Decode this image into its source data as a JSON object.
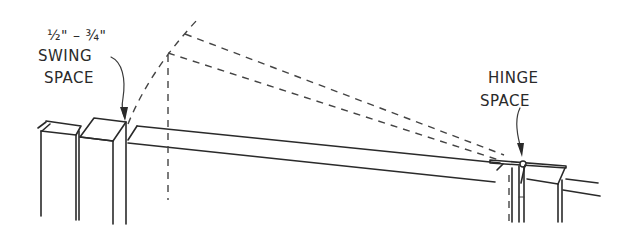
{
  "diagram": {
    "type": "gate-swing-clearance-illustration",
    "labels": {
      "swing_space_dim": "½\" – ¾\"",
      "swing_space_line1": "SWING",
      "swing_space_line2": "SPACE",
      "hinge_space_line1": "HINGE",
      "hinge_space_line2": "SPACE"
    },
    "colors": {
      "line": "#2a2a2a",
      "background": "#ffffff"
    }
  }
}
